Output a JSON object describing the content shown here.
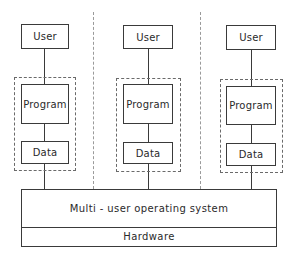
{
  "diagram": {
    "type": "block-diagram",
    "columns": [
      {
        "user": "User",
        "program": "Program",
        "data": "Data"
      },
      {
        "user": "User",
        "program": "Program",
        "data": "Data"
      },
      {
        "user": "User",
        "program": "Program",
        "data": "Data"
      }
    ],
    "os_label": "Multi - user operating system",
    "hardware_label": "Hardware"
  }
}
